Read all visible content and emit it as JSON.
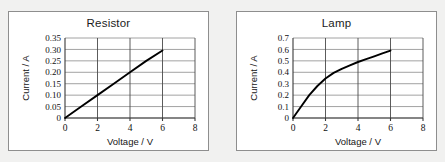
{
  "page": {
    "background_color": "#f1f1f0",
    "card_border_color": "#8e8e8e",
    "grid_color": "#8a8a8a",
    "curve_color": "#000000"
  },
  "charts": [
    {
      "id": "resistor",
      "title": "Resistor",
      "xlabel": "Voltage / V",
      "ylabel": "Current / A",
      "x_ticks": [
        "0",
        "2",
        "4",
        "6",
        "8"
      ],
      "y_ticks": [
        "0",
        "0.05",
        "0.10",
        "0.15",
        "0.20",
        "0.25",
        "0.30",
        "0.35"
      ]
    },
    {
      "id": "lamp",
      "title": "Lamp",
      "xlabel": "Voltage / V",
      "ylabel": "Current / A",
      "x_ticks": [
        "0",
        "2",
        "4",
        "6",
        "8"
      ],
      "y_ticks": [
        "0",
        "0.1",
        "0.2",
        "0.3",
        "0.4",
        "0.5",
        "0.6",
        "0.7"
      ]
    }
  ],
  "chart_data": [
    {
      "type": "line",
      "title": "Resistor",
      "xlabel": "Voltage / V",
      "ylabel": "Current / A",
      "xlim": [
        0,
        8
      ],
      "ylim": [
        0,
        0.35
      ],
      "xticks": [
        0,
        2,
        4,
        6,
        8
      ],
      "yticks": [
        0,
        0.05,
        0.1,
        0.15,
        0.2,
        0.25,
        0.3,
        0.35
      ],
      "grid": true,
      "legend": "none",
      "series": [
        {
          "name": "Resistor I-V",
          "x": [
            0,
            1,
            2,
            3,
            4,
            5,
            6
          ],
          "y": [
            0,
            0.05,
            0.1,
            0.15,
            0.2,
            0.25,
            0.295
          ]
        }
      ]
    },
    {
      "type": "line",
      "title": "Lamp",
      "xlabel": "Voltage / V",
      "ylabel": "Current / A",
      "xlim": [
        0,
        8
      ],
      "ylim": [
        0,
        0.7
      ],
      "xticks": [
        0,
        2,
        4,
        6,
        8
      ],
      "yticks": [
        0,
        0.1,
        0.2,
        0.3,
        0.4,
        0.5,
        0.6,
        0.7
      ],
      "grid": true,
      "legend": "none",
      "series": [
        {
          "name": "Lamp I-V",
          "x": [
            0,
            0.5,
            1,
            1.5,
            2,
            2.5,
            3,
            3.5,
            4,
            4.5,
            5,
            5.5,
            6
          ],
          "y": [
            0,
            0.1,
            0.2,
            0.28,
            0.345,
            0.395,
            0.43,
            0.46,
            0.49,
            0.515,
            0.54,
            0.565,
            0.59
          ]
        }
      ]
    }
  ]
}
